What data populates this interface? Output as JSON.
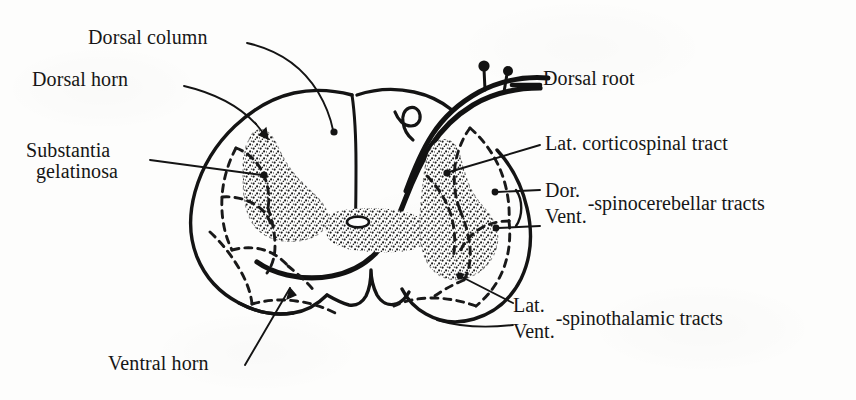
{
  "figure": {
    "background_color": "#fdfdfc",
    "ink_color": "#161616"
  },
  "labels": {
    "dorsal_column": "Dorsal column",
    "dorsal_horn": "Dorsal horn",
    "substantia_line1": "Substantia",
    "substantia_line2": "gelatinosa",
    "ventral_horn": "Ventral horn",
    "dorsal_root": "Dorsal root",
    "lat_corticospinal_tract": "Lat. corticospinal tract",
    "spinocerebellar": {
      "dorsal_abbrev": "Dor.",
      "ventral_abbrev": "Vent.",
      "tract_name": "-spinocerebellar tracts"
    },
    "spinothalamic": {
      "lateral_abbrev": "Lat.",
      "ventral_abbrev": "Vent.",
      "tract_name": "-spinothalamic tracts"
    }
  },
  "structures": {
    "gray_matter": "butterfly-shaped stippled gray matter",
    "white_matter": "surrounding white matter",
    "central_canal": "central canal",
    "dorsal_median_sulcus": "dorsal median sulcus",
    "ventral_median_fissure": "ventral median fissure",
    "dorsal_root_ganglion_cells": "two dorsal root fiber cell bodies"
  }
}
